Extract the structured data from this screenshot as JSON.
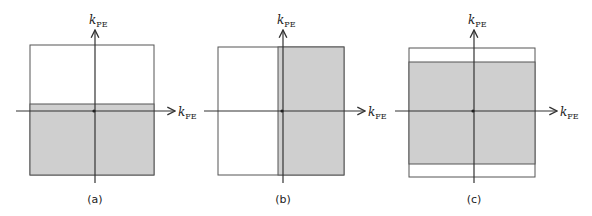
{
  "figure": {
    "panels": [
      {
        "id": "a",
        "caption": "(a)",
        "box": {
          "x": 30,
          "y": 45,
          "w": 124,
          "h": 130
        },
        "shaded": {
          "x": 30,
          "y": 104,
          "w": 124,
          "h": 71
        },
        "origin": {
          "x": 95,
          "y": 111
        },
        "h_axis": {
          "x1": 16,
          "x2": 175
        },
        "v_axis": {
          "y1": 30,
          "y2": 183
        },
        "x_label": "k",
        "x_sub": "FE",
        "y_label": "k",
        "y_sub": "PE",
        "description": "Lower half of k-space sampled (partial Fourier in phase-encode)"
      },
      {
        "id": "b",
        "caption": "(b)",
        "box": {
          "x": 218,
          "y": 47,
          "w": 126,
          "h": 128
        },
        "shaded": {
          "x": 278,
          "y": 47,
          "w": 66,
          "h": 128
        },
        "origin": {
          "x": 283,
          "y": 111
        },
        "h_axis": {
          "x1": 204,
          "x2": 365
        },
        "v_axis": {
          "y1": 30,
          "y2": 183
        },
        "x_label": "k",
        "x_sub": "FE",
        "y_label": "k",
        "y_sub": "PE",
        "description": "Right half of k-space sampled (partial echo in frequency-encode)"
      },
      {
        "id": "c",
        "caption": "(c)",
        "box": {
          "x": 409,
          "y": 48,
          "w": 126,
          "h": 129
        },
        "shaded": {
          "x": 409,
          "y": 62,
          "w": 126,
          "h": 102
        },
        "origin": {
          "x": 474,
          "y": 111
        },
        "h_axis": {
          "x1": 395,
          "x2": 557
        },
        "v_axis": {
          "y1": 30,
          "y2": 183
        },
        "x_label": "k",
        "x_sub": "FE",
        "y_label": "k",
        "y_sub": "PE",
        "description": "Central band of k-space sampled (reduced phase-encode extent)"
      }
    ],
    "colors": {
      "shade": "#cfcfcf",
      "line": "#333333",
      "box_border": "#555555"
    }
  }
}
